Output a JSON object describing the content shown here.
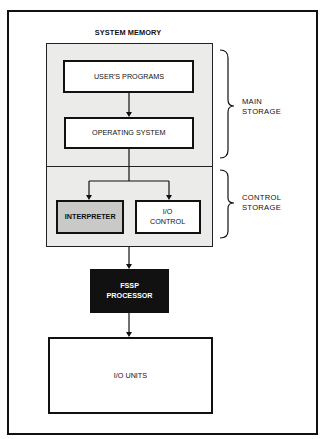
{
  "diagram": {
    "title": "SYSTEM MEMORY",
    "nodes": {
      "users_programs": "USER'S PROGRAMS",
      "operating_system": "OPERATING SYSTEM",
      "interpreter": "INTERPRETER",
      "io_control": "I/O\nCONTROL",
      "fssp_processor": "FSSP\nPROCESSOR",
      "io_units": "I/O UNITS"
    },
    "brace_labels": {
      "main_storage": "MAIN\nSTORAGE",
      "control_storage": "CONTROL\nSTORAGE"
    },
    "edges": [
      {
        "from": "USER'S PROGRAMS",
        "to": "OPERATING SYSTEM"
      },
      {
        "from": "OPERATING SYSTEM",
        "to": "INTERPRETER"
      },
      {
        "from": "OPERATING SYSTEM",
        "to": "I/O CONTROL"
      },
      {
        "from": "SYSTEM MEMORY",
        "to": "FSSP PROCESSOR"
      },
      {
        "from": "FSSP PROCESSOR",
        "to": "I/O UNITS"
      }
    ],
    "colors": {
      "memory_fill": "#ebebea",
      "interpreter_fill": "#c9c9c7",
      "processor_fill": "#111111",
      "line": "#111111"
    }
  }
}
